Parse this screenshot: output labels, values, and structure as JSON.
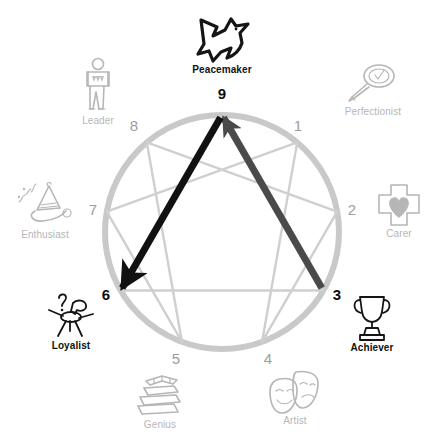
{
  "diagram": {
    "type": "enneagram-wheel",
    "circle": {
      "cx": 222,
      "cy": 232,
      "r": 117,
      "color": "#c9c9c9",
      "stroke_width": 6
    },
    "inner_line_color": "#cfcfcf",
    "highlight_dark": "#111111",
    "highlight_mid": "#4a4a4a",
    "dim_color": "#b6b6b6"
  },
  "points": [
    {
      "number": "9",
      "label": "Peacemaker",
      "icon": "dove-icon",
      "state": "highlight",
      "angle_deg": 270,
      "num_x": 222,
      "num_y": 86,
      "icon_x": 222,
      "icon_y": 14
    },
    {
      "number": "1",
      "label": "Perfectionist",
      "icon": "magnifier-check-icon",
      "state": "dim",
      "angle_deg": 310,
      "num_x": 298,
      "num_y": 118,
      "icon_x": 373,
      "icon_y": 62
    },
    {
      "number": "2",
      "label": "Carer",
      "icon": "cross-heart-icon",
      "state": "dim",
      "angle_deg": 350,
      "num_x": 352,
      "num_y": 202,
      "icon_x": 399,
      "icon_y": 182
    },
    {
      "number": "3",
      "label": "Achiever",
      "icon": "trophy-icon",
      "state": "highlight",
      "angle_deg": 30,
      "num_x": 337,
      "num_y": 287,
      "icon_x": 372,
      "icon_y": 292
    },
    {
      "number": "4",
      "label": "Artist",
      "icon": "theatre-masks-icon",
      "state": "dim",
      "angle_deg": 70,
      "num_x": 268,
      "num_y": 351,
      "icon_x": 295,
      "icon_y": 369
    },
    {
      "number": "5",
      "label": "Genius",
      "icon": "book-stack-icon",
      "state": "dim",
      "angle_deg": 110,
      "num_x": 176,
      "num_y": 351,
      "icon_x": 160,
      "icon_y": 371
    },
    {
      "number": "6",
      "label": "Loyalist",
      "icon": "question-person-icon",
      "state": "highlight",
      "angle_deg": 150,
      "num_x": 106,
      "num_y": 287,
      "icon_x": 71,
      "icon_y": 290
    },
    {
      "number": "7",
      "label": "Enthusiast",
      "icon": "party-horn-icon",
      "state": "dim",
      "angle_deg": 190,
      "num_x": 93,
      "num_y": 202,
      "icon_x": 45,
      "icon_y": 181
    },
    {
      "number": "8",
      "label": "Leader",
      "icon": "standing-person-icon",
      "state": "dim",
      "angle_deg": 230,
      "num_x": 134,
      "num_y": 118,
      "icon_x": 98,
      "icon_y": 57
    }
  ],
  "inner_lines": {
    "triangle": [
      "9",
      "3",
      "6"
    ],
    "hexad": [
      "1",
      "4",
      "2",
      "8",
      "5",
      "7"
    ]
  },
  "arrows": [
    {
      "name": "arrow-3-to-9",
      "from": "3",
      "to": "9",
      "color": "#4a4a4a",
      "width": 7
    },
    {
      "name": "arrow-9-to-6",
      "from": "9",
      "to": "6",
      "color": "#111111",
      "width": 7
    }
  ]
}
